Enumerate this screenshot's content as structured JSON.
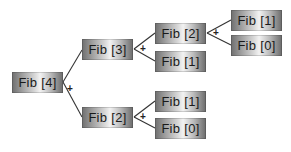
{
  "diagram": {
    "operator": "+",
    "nodes": [
      {
        "id": "n0",
        "label": "Fib [4]",
        "x": 12,
        "y": 72
      },
      {
        "id": "n1",
        "label": "Fib [3]",
        "x": 82,
        "y": 39
      },
      {
        "id": "n2",
        "label": "Fib [2]",
        "x": 82,
        "y": 107
      },
      {
        "id": "n3",
        "label": "Fib [2]",
        "x": 155,
        "y": 23
      },
      {
        "id": "n4",
        "label": "Fib [1]",
        "x": 155,
        "y": 51
      },
      {
        "id": "n5",
        "label": "Fib [1]",
        "x": 231,
        "y": 10
      },
      {
        "id": "n6",
        "label": "Fib [0]",
        "x": 231,
        "y": 35
      },
      {
        "id": "n7",
        "label": "Fib [1]",
        "x": 155,
        "y": 91
      },
      {
        "id": "n8",
        "label": "Fib [0]",
        "x": 155,
        "y": 118
      }
    ],
    "edges": [
      [
        "n0",
        "n1"
      ],
      [
        "n0",
        "n2"
      ],
      [
        "n1",
        "n3"
      ],
      [
        "n1",
        "n4"
      ],
      [
        "n3",
        "n5"
      ],
      [
        "n3",
        "n6"
      ],
      [
        "n2",
        "n7"
      ],
      [
        "n2",
        "n8"
      ]
    ]
  }
}
